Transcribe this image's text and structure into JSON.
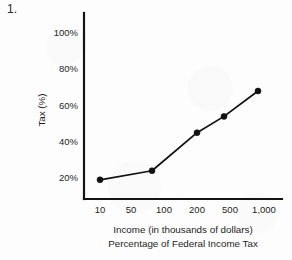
{
  "item_number": "1.",
  "chart_data": {
    "type": "line",
    "title": "",
    "caption_lines": [
      "Income (in thousands of dollars)",
      "Percentage of Federal Income Tax"
    ],
    "xlabel": "Income (in thousands of dollars)",
    "ylabel": "Tax (%)",
    "x_tick_labels": [
      "10",
      "50",
      "100",
      "200",
      "500",
      "1,000"
    ],
    "y_tick_labels": [
      "20%",
      "40%",
      "60%",
      "80%",
      "100%"
    ],
    "y_tick_values": [
      20,
      40,
      60,
      80,
      100
    ],
    "ylim": [
      0,
      110
    ],
    "grid": false,
    "legend": "none",
    "categories": [
      "10",
      "90",
      "200",
      "500",
      "1,000"
    ],
    "values": [
      19,
      24,
      45,
      54,
      68
    ],
    "series": [
      {
        "name": "Percentage of Federal Income Tax",
        "points": [
          {
            "x_label": "10",
            "x_px": 100,
            "y_pct": 19
          },
          {
            "x_label": "90",
            "x_px": 152,
            "y_pct": 24
          },
          {
            "x_label": "200",
            "x_px": 197,
            "y_pct": 45
          },
          {
            "x_label": "500",
            "x_px": 224,
            "y_pct": 54
          },
          {
            "x_label": "1,000",
            "x_px": 258,
            "y_pct": 68
          }
        ]
      }
    ],
    "marker_style": "filled-circle",
    "line_color": "#101010",
    "marker_color": "#101010",
    "axis_color": "#141414"
  }
}
